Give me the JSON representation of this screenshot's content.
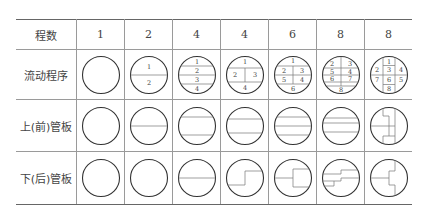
{
  "table": {
    "row_labels": {
      "passes": "程数",
      "flow": "流动程序",
      "top_plate": "上(前)管板",
      "bottom_plate": "下(后)管板"
    },
    "columns": [
      {
        "passes": "1",
        "flow_numbers": []
      },
      {
        "passes": "2",
        "flow_numbers": [
          "1",
          "2"
        ]
      },
      {
        "passes": "4",
        "flow_numbers": [
          "1",
          "2",
          "3",
          "4"
        ]
      },
      {
        "passes": "4",
        "flow_numbers": [
          "1",
          "2",
          "3",
          "4"
        ]
      },
      {
        "passes": "6",
        "flow_numbers": [
          "1",
          "2",
          "3",
          "4",
          "5",
          "6"
        ]
      },
      {
        "passes": "8",
        "flow_numbers": [
          "1",
          "2",
          "3",
          "4",
          "5",
          "6",
          "7",
          "8"
        ]
      },
      {
        "passes": "8",
        "flow_numbers": [
          "1",
          "2",
          "3",
          "4",
          "5",
          "6",
          "7",
          "8"
        ]
      }
    ]
  },
  "colors": {
    "stroke": "#333333",
    "partition": "#777777",
    "grid": "#9a9a9a"
  }
}
